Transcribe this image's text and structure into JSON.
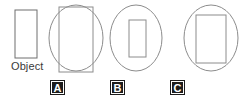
{
  "figure": {
    "caption": "Object",
    "stroke_color": "#8c8c8c",
    "object_stroke_color": "#6e6e6e",
    "label_background": "#1c1c1c",
    "label_text_color": "#ffffff",
    "background": "#ffffff"
  },
  "object_shape": {
    "name": "object-rectangle",
    "type": "rectangle",
    "x": 15,
    "y": 10,
    "width": 22,
    "height": 48
  },
  "choices": [
    {
      "id": "A",
      "label": "A",
      "label_x": 50,
      "label_y": 80,
      "ellipse": {
        "cx": 76,
        "cy": 38,
        "rx": 27,
        "ry": 33
      },
      "rectangle": {
        "x": 59,
        "y": 7,
        "width": 34,
        "height": 65
      },
      "description": "rectangle larger than ellipse, extends past top and bottom"
    },
    {
      "id": "B",
      "label": "B",
      "label_x": 110,
      "label_y": 80,
      "ellipse": {
        "cx": 136,
        "cy": 38,
        "rx": 26,
        "ry": 33
      },
      "rectangle": {
        "x": 129,
        "y": 20,
        "width": 17,
        "height": 37
      },
      "description": "small rectangle fully inside ellipse"
    },
    {
      "id": "C",
      "label": "C",
      "label_x": 170,
      "label_y": 80,
      "ellipse": {
        "cx": 211,
        "cy": 38,
        "rx": 27,
        "ry": 33
      },
      "rectangle": {
        "x": 196,
        "y": 15,
        "width": 30,
        "height": 48
      },
      "description": "medium rectangle inside ellipse"
    }
  ]
}
